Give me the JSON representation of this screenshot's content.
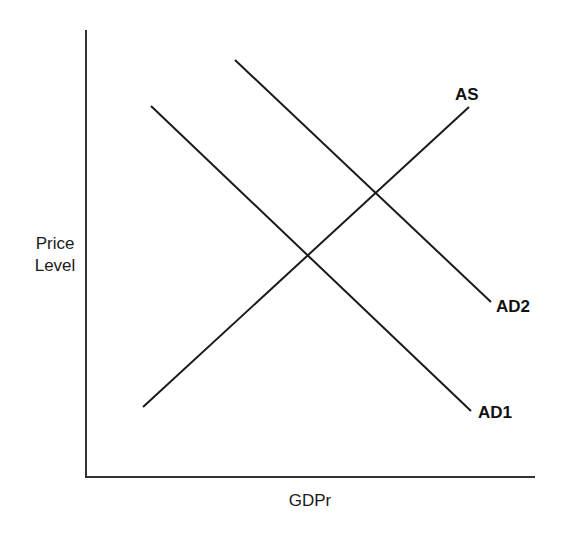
{
  "diagram": {
    "type": "aggregate-supply-aggregate-demand",
    "y_axis": {
      "label_line1": "Price",
      "label_line2": "Level"
    },
    "x_axis": {
      "label": "GDPr"
    },
    "curves": [
      {
        "name": "AS",
        "label": "AS",
        "slope": "upward",
        "from": [
          143,
          407
        ],
        "to": [
          469,
          107
        ]
      },
      {
        "name": "AD1",
        "label": "AD1",
        "slope": "downward",
        "from": [
          151,
          106
        ],
        "to": [
          471,
          411
        ]
      },
      {
        "name": "AD2",
        "label": "AD2",
        "slope": "downward",
        "from": [
          235,
          60
        ],
        "to": [
          491,
          302
        ]
      }
    ],
    "intersections": [
      {
        "curves": [
          "AD1",
          "AS"
        ],
        "point": [
          309,
          256
        ]
      },
      {
        "curves": [
          "AD2",
          "AS"
        ],
        "point": [
          376,
          194
        ]
      }
    ],
    "colors": {
      "line": "#1a1a1a",
      "axis": "#333333",
      "background": "#ffffff"
    }
  }
}
